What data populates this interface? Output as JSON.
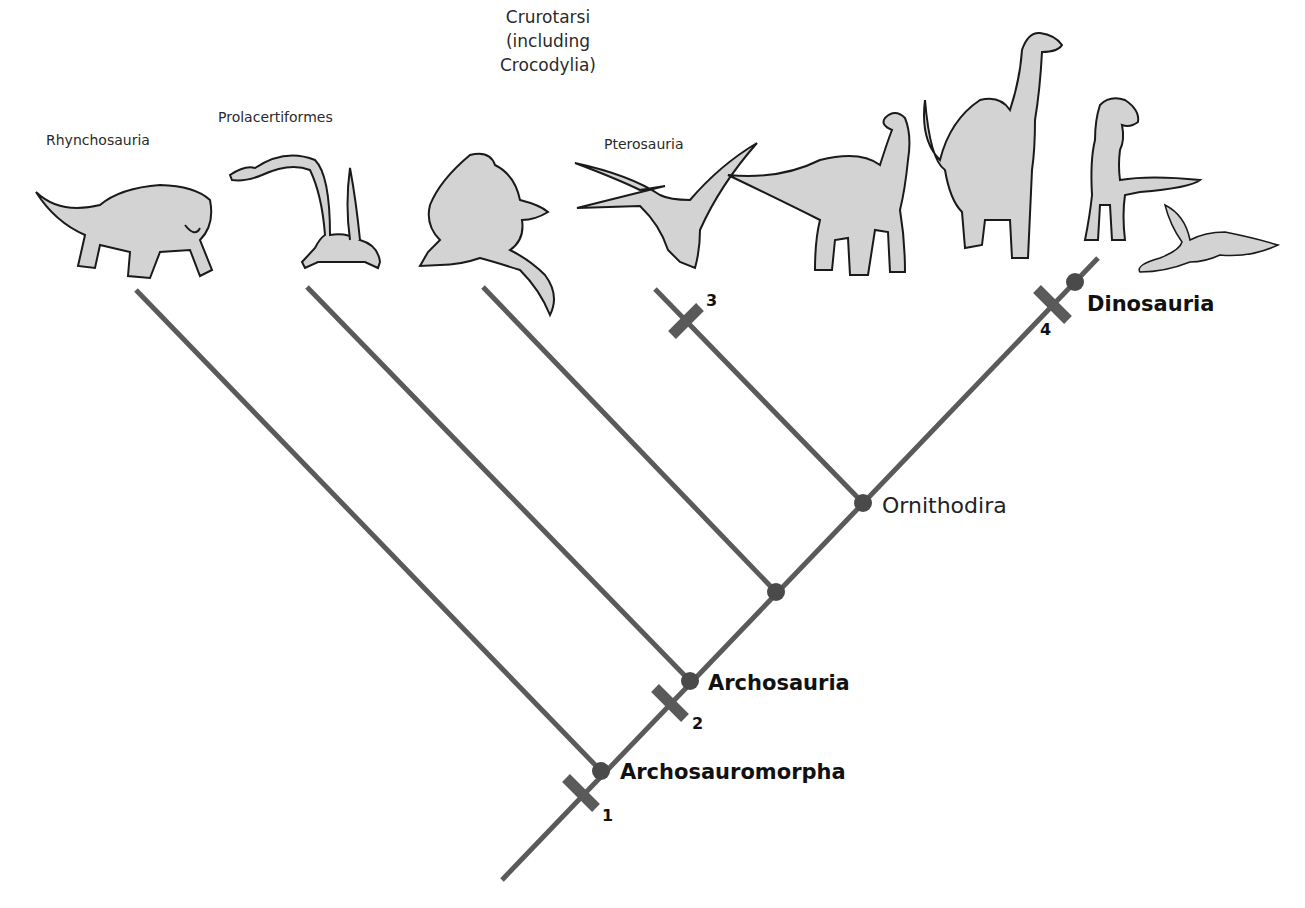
{
  "diagram": {
    "type": "cladogram",
    "colors": {
      "branch": "#5a5a5a",
      "node": "#4a4a4a",
      "tick": "#5a5a5a",
      "animal_fill": "#d3d3d3",
      "animal_stroke": "#1a1a1a"
    },
    "taxa": [
      {
        "id": "rhynchosauria",
        "label": "Rhynchosauria"
      },
      {
        "id": "prolacertiformes",
        "label": "Prolacertiformes"
      },
      {
        "id": "crurotarsi",
        "label_lines": [
          "Crurotarsi",
          "(including",
          "Crocodylia)"
        ]
      },
      {
        "id": "pterosauria",
        "label": "Pterosauria"
      },
      {
        "id": "dinosaurs",
        "label": ""
      }
    ],
    "clades": [
      {
        "id": "archosauromorpha",
        "label": "Archosauromorpha",
        "weight": "bold"
      },
      {
        "id": "archosauria",
        "label": "Archosauria",
        "weight": "bold"
      },
      {
        "id": "unnamed",
        "label": ""
      },
      {
        "id": "ornithodira",
        "label": "Ornithodira",
        "weight": "normal"
      },
      {
        "id": "dinosauria",
        "label": "Dinosauria",
        "weight": "bold"
      }
    ],
    "characters": [
      {
        "number": "1"
      },
      {
        "number": "2"
      },
      {
        "number": "3"
      },
      {
        "number": "4"
      }
    ]
  }
}
